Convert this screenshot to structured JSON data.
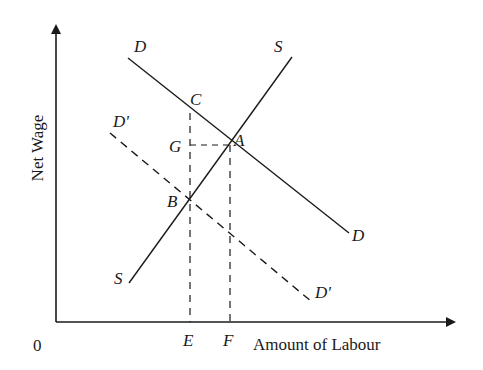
{
  "diagram": {
    "type": "labour-market supply-demand diagram",
    "y_axis_label": "Net Wage",
    "x_axis_label": "Amount of Labour",
    "origin_label": "0",
    "curves": {
      "demand": {
        "start_label": "D",
        "end_label": "D",
        "style": "solid"
      },
      "supply": {
        "start_label": "S",
        "end_label": "S",
        "style": "solid"
      },
      "demand_shifted": {
        "start_label": "D'",
        "end_label": "D'",
        "style": "dashed"
      }
    },
    "points": {
      "A": "A",
      "B": "B",
      "C": "C",
      "G": "G",
      "E": "E",
      "F": "F"
    },
    "colors": {
      "line": "#1a1a1a",
      "background": "#ffffff"
    }
  }
}
